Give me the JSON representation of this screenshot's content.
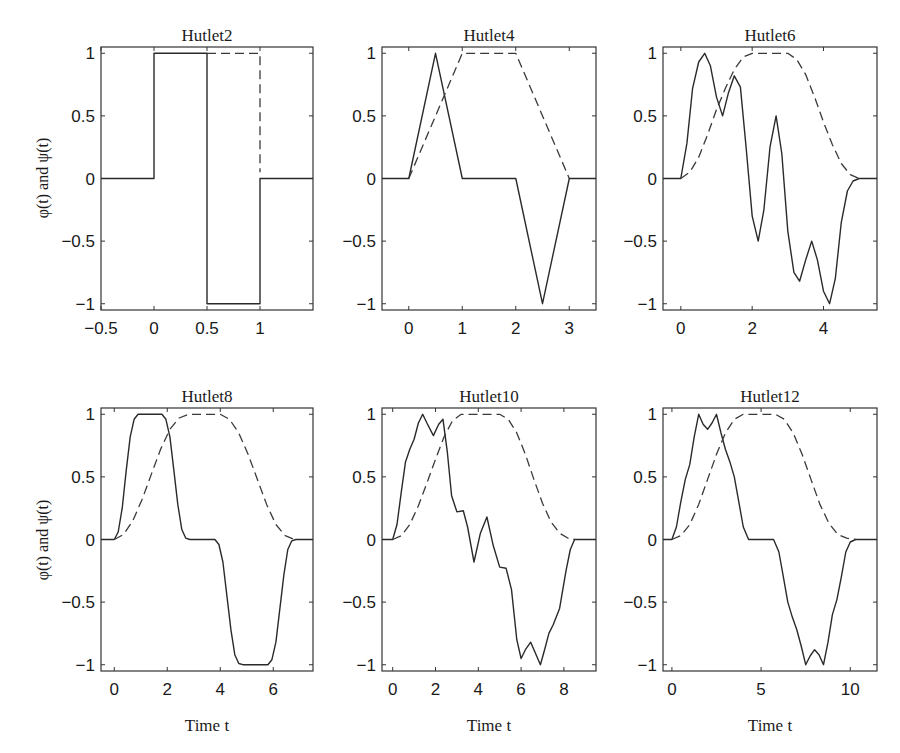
{
  "figure": {
    "ylabel": "φ(t) and ψ(t)",
    "xlabel": "Time t",
    "colors": {
      "line": "#2a2a2a",
      "axes": "#333333",
      "background": "#ffffff"
    }
  },
  "chart_data": [
    {
      "type": "line",
      "title": "Hutlet2",
      "xlabel": "",
      "ylabel": "φ(t) and ψ(t)",
      "xlim": [
        -0.5,
        1.5
      ],
      "ylim": [
        -1.05,
        1.05
      ],
      "xticks": [
        -0.5,
        0,
        0.5,
        1
      ],
      "xtick_labels": [
        "−0.5",
        "0",
        "0.5",
        "1"
      ],
      "yticks": [
        -1,
        -0.5,
        0,
        0.5,
        1
      ],
      "ytick_labels": [
        "−1",
        "−0.5",
        "0",
        "0.5",
        "1"
      ],
      "grid": false,
      "series": [
        {
          "name": "ψ(t) wavelet (solid)",
          "style": "solid",
          "x": [
            -0.5,
            0,
            0,
            0.5,
            0.5,
            1,
            1,
            1.5
          ],
          "y": [
            0,
            0,
            1,
            1,
            -1,
            -1,
            0,
            0
          ]
        },
        {
          "name": "φ(t) scaling function (dashed)",
          "style": "dashed",
          "x": [
            0.5,
            1,
            1
          ],
          "y": [
            1,
            1,
            0.05
          ]
        }
      ]
    },
    {
      "type": "line",
      "title": "Hutlet4",
      "xlabel": "",
      "ylabel": "",
      "xlim": [
        -0.5,
        3.5
      ],
      "ylim": [
        -1.05,
        1.05
      ],
      "xticks": [
        0,
        1,
        2,
        3
      ],
      "xtick_labels": [
        "0",
        "1",
        "2",
        "3"
      ],
      "yticks": [
        -1,
        -0.5,
        0,
        0.5,
        1
      ],
      "ytick_labels": [
        "−1",
        "−0.5",
        "0",
        "0.5",
        "1"
      ],
      "grid": false,
      "series": [
        {
          "name": "ψ(t) wavelet (solid)",
          "style": "solid",
          "x": [
            -0.5,
            0,
            0.5,
            1,
            2,
            2.5,
            3,
            3.5
          ],
          "y": [
            0,
            0,
            1,
            0,
            0,
            -1,
            0,
            0
          ]
        },
        {
          "name": "φ(t) scaling function (dashed)",
          "style": "dashed",
          "x": [
            0,
            1,
            2,
            3
          ],
          "y": [
            0,
            1,
            1,
            0
          ]
        }
      ]
    },
    {
      "type": "line",
      "title": "Hutlet6",
      "xlabel": "",
      "ylabel": "",
      "xlim": [
        -0.5,
        5.5
      ],
      "ylim": [
        -1.05,
        1.05
      ],
      "xticks": [
        0,
        2,
        4
      ],
      "xtick_labels": [
        "0",
        "2",
        "4"
      ],
      "yticks": [
        -1,
        -0.5,
        0,
        0.5,
        1
      ],
      "ytick_labels": [
        "−1",
        "−0.5",
        "0",
        "0.5",
        "1"
      ],
      "grid": false,
      "series": [
        {
          "name": "ψ(t) wavelet (solid)",
          "style": "solid",
          "x": [
            -0.5,
            0,
            0.17,
            0.33,
            0.5,
            0.67,
            0.83,
            1.0,
            1.17,
            1.33,
            1.5,
            1.67,
            1.83,
            2.0,
            2.17,
            2.33,
            2.5,
            2.67,
            2.83,
            3.0,
            3.17,
            3.33,
            3.5,
            3.67,
            3.83,
            4.0,
            4.17,
            4.33,
            4.5,
            4.67,
            4.83,
            5.0,
            5.5
          ],
          "y": [
            0,
            0,
            0.28,
            0.72,
            0.93,
            1.0,
            0.9,
            0.65,
            0.5,
            0.68,
            0.82,
            0.73,
            0.25,
            -0.3,
            -0.5,
            -0.25,
            0.25,
            0.5,
            0.2,
            -0.42,
            -0.75,
            -0.82,
            -0.65,
            -0.5,
            -0.65,
            -0.9,
            -1.0,
            -0.8,
            -0.35,
            -0.1,
            -0.02,
            0,
            0
          ]
        },
        {
          "name": "φ(t) scaling function (dashed)",
          "style": "dashed",
          "x": [
            0,
            0.25,
            0.5,
            0.75,
            1.0,
            1.25,
            1.5,
            1.75,
            2.0,
            2.5,
            3.0,
            3.25,
            3.5,
            3.75,
            4.0,
            4.25,
            4.5,
            4.75,
            5.0
          ],
          "y": [
            0,
            0.05,
            0.17,
            0.35,
            0.55,
            0.72,
            0.87,
            0.97,
            1.0,
            1.0,
            1.0,
            0.95,
            0.83,
            0.65,
            0.45,
            0.27,
            0.12,
            0.03,
            0
          ]
        }
      ]
    },
    {
      "type": "line",
      "title": "Hutlet8",
      "xlabel": "Time t",
      "ylabel": "φ(t) and ψ(t)",
      "xlim": [
        -0.5,
        7.5
      ],
      "ylim": [
        -1.05,
        1.05
      ],
      "xticks": [
        0,
        2,
        4,
        6
      ],
      "xtick_labels": [
        "0",
        "2",
        "4",
        "6"
      ],
      "yticks": [
        -1,
        -0.5,
        0,
        0.5,
        1
      ],
      "ytick_labels": [
        "−1",
        "−0.5",
        "0",
        "0.5",
        "1"
      ],
      "grid": false,
      "series": [
        {
          "name": "ψ(t) wavelet (solid)",
          "style": "solid",
          "x": [
            -0.5,
            0,
            0.15,
            0.3,
            0.45,
            0.6,
            0.75,
            0.9,
            1.8,
            1.95,
            2.1,
            2.25,
            2.4,
            2.55,
            2.7,
            2.85,
            3.8,
            3.95,
            4.1,
            4.25,
            4.4,
            4.55,
            4.7,
            4.85,
            5.8,
            5.95,
            6.1,
            6.25,
            6.4,
            6.55,
            6.7,
            6.85,
            7.5
          ],
          "y": [
            0,
            0,
            0.06,
            0.25,
            0.55,
            0.82,
            0.96,
            1.0,
            1.0,
            0.96,
            0.82,
            0.55,
            0.28,
            0.08,
            0.01,
            0,
            0,
            -0.04,
            -0.18,
            -0.45,
            -0.72,
            -0.92,
            -0.99,
            -1.0,
            -1.0,
            -0.96,
            -0.82,
            -0.55,
            -0.28,
            -0.08,
            -0.01,
            0,
            0
          ]
        },
        {
          "name": "φ(t) scaling function (dashed)",
          "style": "dashed",
          "x": [
            0,
            0.35,
            0.7,
            1.05,
            1.4,
            1.75,
            2.1,
            2.45,
            2.8,
            3.4,
            4.0,
            4.35,
            4.7,
            5.05,
            5.4,
            5.75,
            6.1,
            6.45,
            6.8
          ],
          "y": [
            0,
            0.04,
            0.15,
            0.32,
            0.52,
            0.72,
            0.88,
            0.97,
            1.0,
            1.0,
            1.0,
            0.96,
            0.85,
            0.68,
            0.48,
            0.28,
            0.12,
            0.03,
            0
          ]
        }
      ]
    },
    {
      "type": "line",
      "title": "Hutlet10",
      "xlabel": "Time t",
      "ylabel": "",
      "xlim": [
        -0.5,
        9.5
      ],
      "ylim": [
        -1.05,
        1.05
      ],
      "xticks": [
        0,
        2,
        4,
        6,
        8
      ],
      "xtick_labels": [
        "0",
        "2",
        "4",
        "6",
        "8"
      ],
      "yticks": [
        -1,
        -0.5,
        0,
        0.5,
        1
      ],
      "ytick_labels": [
        "−1",
        "−0.5",
        "0",
        "0.5",
        "1"
      ],
      "grid": false,
      "series": [
        {
          "name": "ψ(t) wavelet (solid)",
          "style": "solid",
          "x": [
            -0.5,
            0,
            0.2,
            0.4,
            0.6,
            0.8,
            1.0,
            1.2,
            1.4,
            1.6,
            1.9,
            2.15,
            2.35,
            2.55,
            2.75,
            3.0,
            3.3,
            3.5,
            3.8,
            4.1,
            4.4,
            4.7,
            5.0,
            5.3,
            5.55,
            5.8,
            6.0,
            6.2,
            6.45,
            6.7,
            6.9,
            7.1,
            7.3,
            7.5,
            7.8,
            8.1,
            8.3,
            8.5,
            9.5
          ],
          "y": [
            0,
            0,
            0.12,
            0.38,
            0.62,
            0.72,
            0.8,
            0.93,
            1.0,
            0.93,
            0.83,
            0.92,
            0.96,
            0.7,
            0.35,
            0.22,
            0.23,
            0.1,
            -0.18,
            0.05,
            0.18,
            -0.05,
            -0.22,
            -0.23,
            -0.4,
            -0.8,
            -0.95,
            -0.88,
            -0.82,
            -0.92,
            -1.0,
            -0.88,
            -0.75,
            -0.68,
            -0.55,
            -0.25,
            -0.08,
            0,
            0
          ]
        },
        {
          "name": "φ(t) scaling function (dashed)",
          "style": "dashed",
          "x": [
            0,
            0.4,
            0.8,
            1.2,
            1.6,
            2.0,
            2.4,
            2.8,
            3.2,
            4.1,
            5.0,
            5.4,
            5.8,
            6.2,
            6.6,
            7.0,
            7.4,
            7.8,
            8.2,
            8.5
          ],
          "y": [
            0,
            0.03,
            0.12,
            0.27,
            0.45,
            0.64,
            0.82,
            0.95,
            1.0,
            1.0,
            1.0,
            0.96,
            0.85,
            0.68,
            0.48,
            0.29,
            0.14,
            0.05,
            0.01,
            0
          ]
        }
      ]
    },
    {
      "type": "line",
      "title": "Hutlet12",
      "xlabel": "Time t",
      "ylabel": "",
      "xlim": [
        -0.5,
        11.5
      ],
      "ylim": [
        -1.05,
        1.05
      ],
      "xticks": [
        0,
        5,
        10
      ],
      "xtick_labels": [
        "0",
        "5",
        "10"
      ],
      "yticks": [
        -1,
        -0.5,
        0,
        0.5,
        1
      ],
      "ytick_labels": [
        "−1",
        "−0.5",
        "0",
        "0.5",
        "1"
      ],
      "grid": false,
      "series": [
        {
          "name": "ψ(t) wavelet (solid)",
          "style": "solid",
          "x": [
            -0.5,
            0,
            0.25,
            0.5,
            0.75,
            1.0,
            1.25,
            1.5,
            1.75,
            2.0,
            2.25,
            2.5,
            2.75,
            3.0,
            3.25,
            3.5,
            3.75,
            4.0,
            4.3,
            5.7,
            6.0,
            6.25,
            6.5,
            6.75,
            7.0,
            7.25,
            7.5,
            7.75,
            8.0,
            8.25,
            8.5,
            8.75,
            9.0,
            9.25,
            9.5,
            9.75,
            10.0,
            10.3,
            11.5
          ],
          "y": [
            0,
            0,
            0.1,
            0.3,
            0.48,
            0.6,
            0.82,
            1.0,
            0.92,
            0.88,
            0.93,
            1.0,
            0.85,
            0.72,
            0.62,
            0.5,
            0.3,
            0.1,
            0,
            0,
            -0.1,
            -0.3,
            -0.5,
            -0.62,
            -0.72,
            -0.85,
            -1.0,
            -0.93,
            -0.88,
            -0.92,
            -1.0,
            -0.82,
            -0.6,
            -0.48,
            -0.3,
            -0.1,
            -0.02,
            0,
            0
          ]
        },
        {
          "name": "φ(t) scaling function (dashed)",
          "style": "dashed",
          "x": [
            0,
            0.5,
            1.0,
            1.5,
            2.0,
            2.5,
            3.0,
            3.5,
            4.0,
            4.9,
            5.8,
            6.3,
            6.8,
            7.3,
            7.8,
            8.3,
            8.8,
            9.3,
            9.8,
            10.3
          ],
          "y": [
            0,
            0.03,
            0.12,
            0.28,
            0.48,
            0.68,
            0.85,
            0.96,
            1.0,
            1.0,
            1.0,
            0.96,
            0.85,
            0.68,
            0.48,
            0.28,
            0.13,
            0.04,
            0.01,
            0
          ]
        }
      ]
    }
  ]
}
